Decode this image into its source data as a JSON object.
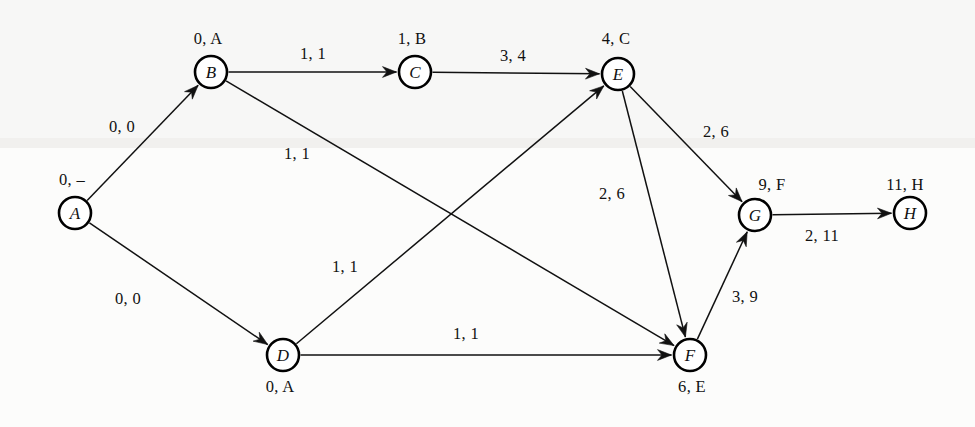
{
  "diagram": {
    "node_radius": 16,
    "stroke_color": "#111111",
    "background_color": "#fdfdfc",
    "nodes": [
      {
        "id": "A",
        "letter": "A",
        "x": 75,
        "y": 213,
        "annotation": "0, –",
        "annotation_x": 72,
        "annotation_y": 181
      },
      {
        "id": "B",
        "letter": "B",
        "x": 211,
        "y": 72,
        "annotation": "0, A",
        "annotation_x": 208,
        "annotation_y": 40
      },
      {
        "id": "C",
        "letter": "C",
        "x": 415,
        "y": 72,
        "annotation": "1, B",
        "annotation_x": 412,
        "annotation_y": 40
      },
      {
        "id": "D",
        "letter": "D",
        "x": 283,
        "y": 355,
        "annotation": "0, A",
        "annotation_x": 280,
        "annotation_y": 388
      },
      {
        "id": "E",
        "letter": "E",
        "x": 618,
        "y": 74,
        "annotation": "4, C",
        "annotation_x": 616,
        "annotation_y": 40
      },
      {
        "id": "F",
        "letter": "F",
        "x": 690,
        "y": 355,
        "annotation": "6, E",
        "annotation_x": 692,
        "annotation_y": 388
      },
      {
        "id": "G",
        "letter": "G",
        "x": 755,
        "y": 215,
        "annotation": "9, F",
        "annotation_x": 772,
        "annotation_y": 186
      },
      {
        "id": "H",
        "letter": "H",
        "x": 910,
        "y": 213,
        "annotation": "11, H",
        "annotation_x": 905,
        "annotation_y": 186
      }
    ],
    "edges": [
      {
        "id": "A-B",
        "from": "A",
        "to": "B",
        "label": "0, 0",
        "label_x": 122,
        "label_y": 128
      },
      {
        "id": "A-D",
        "from": "A",
        "to": "D",
        "label": "0, 0",
        "label_x": 128,
        "label_y": 300
      },
      {
        "id": "B-C",
        "from": "B",
        "to": "C",
        "label": "1, 1",
        "label_x": 313,
        "label_y": 55
      },
      {
        "id": "B-F",
        "from": "B",
        "to": "F",
        "label": "1, 1",
        "label_x": 297,
        "label_y": 155
      },
      {
        "id": "C-E",
        "from": "C",
        "to": "E",
        "label": "3, 4",
        "label_x": 513,
        "label_y": 57
      },
      {
        "id": "D-E",
        "from": "D",
        "to": "E",
        "label": "1, 1",
        "label_x": 345,
        "label_y": 268
      },
      {
        "id": "D-F",
        "from": "D",
        "to": "F",
        "label": "1, 1",
        "label_x": 466,
        "label_y": 335
      },
      {
        "id": "E-F",
        "from": "E",
        "to": "F",
        "label": "2, 6",
        "label_x": 612,
        "label_y": 195
      },
      {
        "id": "E-G",
        "from": "E",
        "to": "G",
        "label": "2, 6",
        "label_x": 716,
        "label_y": 133
      },
      {
        "id": "F-G",
        "from": "F",
        "to": "G",
        "label": "3, 9",
        "label_x": 745,
        "label_y": 298
      },
      {
        "id": "G-H",
        "from": "G",
        "to": "H",
        "label": "2, 11",
        "label_x": 822,
        "label_y": 237
      }
    ]
  }
}
